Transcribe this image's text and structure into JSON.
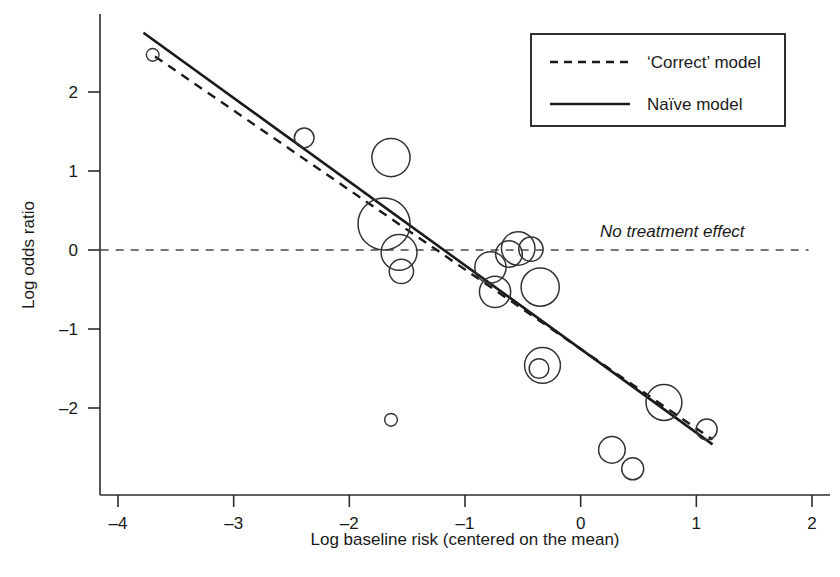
{
  "chart_data": {
    "type": "scatter",
    "title": "",
    "subtitle": "",
    "xlabel": "Log baseline risk (centered on the mean)",
    "ylabel": "Log odds ratio",
    "xlim": [
      -4.15,
      2.05
    ],
    "ylim": [
      -2.95,
      2.82
    ],
    "xticks": [
      -4,
      -3,
      -2,
      -1,
      0,
      1,
      2
    ],
    "xticklabels": [
      "–4",
      "–3",
      "–2",
      "–1",
      "0",
      "1",
      "2"
    ],
    "yticks": [
      -2,
      -1,
      0,
      1,
      2
    ],
    "yticklabels": [
      "–2",
      "–1",
      "0",
      "1",
      "2"
    ],
    "grid": false,
    "marker": "open-circle-bubble",
    "bubble_note": "Circle radius encodes study weight / precision",
    "points": [
      {
        "x": -3.7,
        "y": 2.47,
        "r": 0.055
      },
      {
        "x": -2.39,
        "y": 1.42,
        "r": 0.085
      },
      {
        "x": -1.64,
        "y": 1.17,
        "r": 0.165
      },
      {
        "x": -1.7,
        "y": 0.33,
        "r": 0.225
      },
      {
        "x": -1.57,
        "y": -0.03,
        "r": 0.155
      },
      {
        "x": -1.55,
        "y": -0.27,
        "r": 0.105
      },
      {
        "x": -1.64,
        "y": -2.15,
        "r": 0.055
      },
      {
        "x": -0.78,
        "y": -0.22,
        "r": 0.135
      },
      {
        "x": -0.74,
        "y": -0.53,
        "r": 0.135
      },
      {
        "x": -0.62,
        "y": -0.05,
        "r": 0.115
      },
      {
        "x": -0.54,
        "y": 0.02,
        "r": 0.145
      },
      {
        "x": -0.43,
        "y": 0.01,
        "r": 0.105
      },
      {
        "x": -0.35,
        "y": -0.47,
        "r": 0.165
      },
      {
        "x": -0.33,
        "y": -1.46,
        "r": 0.155
      },
      {
        "x": -0.36,
        "y": -1.5,
        "r": 0.085
      },
      {
        "x": 0.27,
        "y": -2.53,
        "r": 0.115
      },
      {
        "x": 0.45,
        "y": -2.77,
        "r": 0.095
      },
      {
        "x": 0.72,
        "y": -1.93,
        "r": 0.155
      },
      {
        "x": 1.09,
        "y": -2.27,
        "r": 0.09
      }
    ],
    "lines": [
      {
        "name": "'Correct' model",
        "style": "dashed",
        "x0": -3.68,
        "y0": 2.45,
        "x1": 1.14,
        "y1": -2.4
      },
      {
        "name": "Naïve model",
        "style": "solid",
        "x0": -3.78,
        "y0": 2.75,
        "x1": 1.14,
        "y1": -2.46
      }
    ],
    "reference_line": {
      "name": "No treatment effect",
      "style": "dashed",
      "y": 0,
      "x0": -4.15,
      "x1": 1.97
    }
  },
  "legend": {
    "position": "top-right",
    "entries": [
      {
        "label": "‘Correct’ model",
        "style": "dashed"
      },
      {
        "label": "Naïve model",
        "style": "solid"
      }
    ]
  },
  "annotations": [
    {
      "name": "no-treatment-effect",
      "text": "No treatment effect",
      "style": "italic"
    }
  ]
}
